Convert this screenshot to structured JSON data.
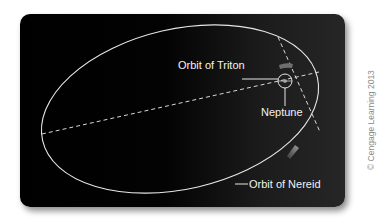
{
  "diagram": {
    "labels": {
      "triton_orbit": "Orbit of Triton",
      "neptune": "Neptune",
      "nereid_orbit": "Orbit of Nereid"
    },
    "credit": "© Cengage Learning 2013",
    "colors": {
      "background": "#000000",
      "orbit_line": "#e6e6e6",
      "label_text": "#f2f2f2",
      "arrow": "#7a7a7a",
      "credit_text": "#8a8a8a"
    }
  }
}
